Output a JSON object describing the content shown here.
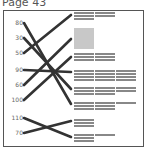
{
  "page": {
    "title": "Page 43"
  },
  "diagram": {
    "type": "matching-exercise",
    "left_labels": [
      {
        "text": "80",
        "y": 23
      },
      {
        "text": "30",
        "y": 38
      },
      {
        "text": "50",
        "y": 53
      },
      {
        "text": "90",
        "y": 70
      },
      {
        "text": "60",
        "y": 85
      },
      {
        "text": "100",
        "y": 100
      },
      {
        "text": "110",
        "y": 118
      },
      {
        "text": "70",
        "y": 133
      }
    ],
    "connections": [
      {
        "from": "80",
        "to_block": 6
      },
      {
        "from": "30",
        "to_block": 5
      },
      {
        "from": "50",
        "to_block": 1
      },
      {
        "from": "90",
        "to_block": 4
      },
      {
        "from": "60",
        "to_block": 2
      },
      {
        "from": "100",
        "to_block": 3
      },
      {
        "from": "110",
        "to_block": 8
      },
      {
        "from": "70",
        "to_block": 7
      }
    ],
    "colors": {
      "line": "#333333",
      "text_block": "#888888",
      "image_block": "#c8c8c8",
      "frame": "#555555"
    }
  }
}
